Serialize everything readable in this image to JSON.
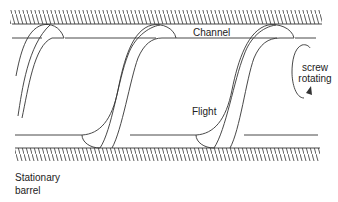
{
  "diagram": {
    "labels": {
      "channel": "Channel",
      "flight": "Flight",
      "rotation_line1": "screw",
      "rotation_line2": "rotating",
      "barrel_line1": "Stationary",
      "barrel_line2": "barrel"
    },
    "colors": {
      "line": "#333333",
      "background": "#ffffff"
    }
  }
}
